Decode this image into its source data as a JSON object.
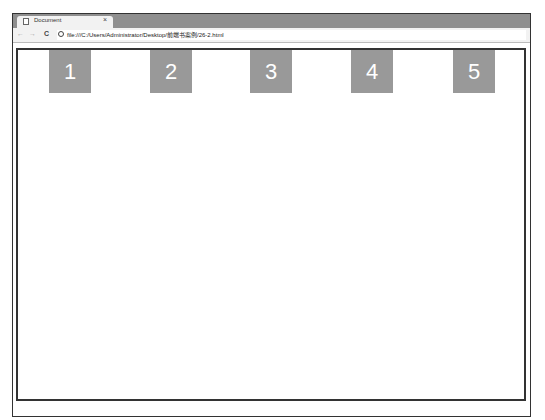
{
  "browser": {
    "tab": {
      "title": "Document",
      "close": "×",
      "icon": "document-icon"
    },
    "nav": {
      "back": "←",
      "forward": "→",
      "reload": "C"
    },
    "address": "file:///C:/Users/Administrator/Desktop/前端书案例/26-2.html"
  },
  "page": {
    "boxes": [
      {
        "label": "1"
      },
      {
        "label": "2"
      },
      {
        "label": "3"
      },
      {
        "label": "4"
      },
      {
        "label": "5"
      }
    ],
    "box_color": "#999999"
  }
}
